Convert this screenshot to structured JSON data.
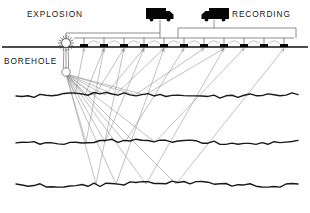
{
  "figure": {
    "background_color": "#ffffff"
  },
  "labels": {
    "explosion": "EXPLOSION",
    "recording": "RECORDING",
    "borehole": "BOREHOLE"
  },
  "colors": {
    "ink": "#111111",
    "ray": "#8d8d8d",
    "cable": "#5d5d5d",
    "truck": "#050505",
    "geophone": "#080808"
  },
  "vehicles": [
    {
      "name": "explosion-truck",
      "label": "EXPLOSION",
      "label_side": "left",
      "facing": "right",
      "x": 145,
      "y": 6
    },
    {
      "name": "recording-truck",
      "label": "RECORDING",
      "label_side": "right",
      "facing": "left",
      "x": 200,
      "y": 6
    }
  ],
  "surface": {
    "y": 47,
    "x_start": 2,
    "x_end": 308
  },
  "borehole": {
    "x": 66,
    "surface_y": 47,
    "charge_y": 72,
    "charge_radius": 4.2,
    "burst_spikes": 16,
    "burst_radius": 8
  },
  "geophones": {
    "count": 11,
    "y": 47,
    "x_positions": [
      84,
      104,
      124,
      144,
      164,
      184,
      204,
      224,
      244,
      264,
      284
    ],
    "width": 8,
    "height": 3
  },
  "cable": {
    "explosion_trunk_y": 33,
    "recording_trunk_y": 28,
    "explosion_trunk_x_start": 66,
    "explosion_trunk_x_end": 160,
    "recording_trunk_x_start": 178,
    "recording_trunk_x_end": 296
  },
  "reflectors": [
    {
      "name": "reflector-1",
      "y": 95,
      "label": ""
    },
    {
      "name": "reflector-2",
      "y": 142,
      "label": ""
    },
    {
      "name": "reflector-3",
      "y": 184,
      "label": ""
    }
  ],
  "raypaths": {
    "source_x": 66,
    "source_y": 74,
    "description": "Downgoing rays from the shot charge reflect off subsurface layers and return upward to the geophone array",
    "paths": [
      {
        "receiver_x": 84,
        "bounce_x": 75,
        "bounce_y": 95
      },
      {
        "receiver_x": 104,
        "bounce_x": 85,
        "bounce_y": 95
      },
      {
        "receiver_x": 124,
        "bounce_x": 95,
        "bounce_y": 95
      },
      {
        "receiver_x": 144,
        "bounce_x": 105,
        "bounce_y": 95
      },
      {
        "receiver_x": 164,
        "bounce_x": 115,
        "bounce_y": 95
      },
      {
        "receiver_x": 204,
        "bounce_x": 135,
        "bounce_y": 95
      },
      {
        "receiver_x": 224,
        "bounce_x": 145,
        "bounce_y": 95
      },
      {
        "receiver_x": 104,
        "bounce_x": 86,
        "bounce_y": 142
      },
      {
        "receiver_x": 144,
        "bounce_x": 105,
        "bounce_y": 142
      },
      {
        "receiver_x": 184,
        "bounce_x": 125,
        "bounce_y": 142
      },
      {
        "receiver_x": 244,
        "bounce_x": 155,
        "bounce_y": 142
      },
      {
        "receiver_x": 124,
        "bounce_x": 96,
        "bounce_y": 184
      },
      {
        "receiver_x": 164,
        "bounce_x": 116,
        "bounce_y": 184
      },
      {
        "receiver_x": 224,
        "bounce_x": 146,
        "bounce_y": 184
      },
      {
        "receiver_x": 284,
        "bounce_x": 176,
        "bounce_y": 184
      }
    ]
  }
}
